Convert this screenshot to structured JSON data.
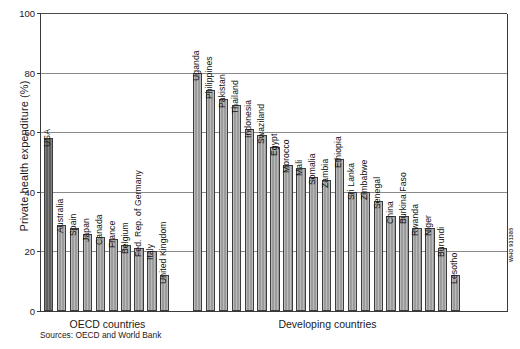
{
  "chart_data": {
    "type": "bar",
    "title": "",
    "xlabel": "",
    "ylabel": "Private health expenditure (%)",
    "ylim": [
      0,
      100
    ],
    "yticks": [
      0,
      20,
      40,
      60,
      80,
      100
    ],
    "grid": true,
    "legend": "none",
    "groups": [
      {
        "name": "OECD countries",
        "categories": [
          "USA",
          "Australia",
          "Spain",
          "Japan",
          "Canada",
          "France",
          "Belgium",
          "Fed. Rep. of Germany",
          "Italy",
          "United Kingdom"
        ],
        "values": [
          58,
          29,
          28,
          26,
          25,
          24,
          22,
          21,
          20,
          12
        ]
      },
      {
        "name": "Developing countries",
        "categories": [
          "Uganda",
          "Philippines",
          "Pakistan",
          "Thailand",
          "Indonesia",
          "Swaziland",
          "Egypt",
          "Morocco",
          "Mali",
          "Somalia",
          "Zambia",
          "Ethiopia",
          "Sri Lanka",
          "Zimbabwe",
          "Senegal",
          "China",
          "Burkina Faso",
          "Rwanda",
          "Niger",
          "Burundi",
          "Lesotho"
        ],
        "values": [
          80,
          74,
          71,
          69,
          61,
          59,
          55,
          49,
          48,
          45,
          44,
          51,
          40,
          40,
          37,
          32,
          32,
          28,
          28,
          21,
          12
        ]
      }
    ],
    "bar_colors": {
      "highlight": "#5e5e5e",
      "default": "#9c9c9c",
      "outline": "#3c3c3c"
    },
    "axis_color": "#3a3a3a",
    "gridline_color": "#8a8a8a"
  },
  "axis": {
    "y_title": "Private health expenditure (%)",
    "ticks": [
      "100",
      "80",
      "60",
      "40",
      "20",
      "0"
    ]
  },
  "captions": {
    "oecd": "OECD countries",
    "developing": "Developing countries"
  },
  "footer": {
    "sources": "Sources: OECD and World Bank",
    "watermark": "WHO 931385"
  }
}
